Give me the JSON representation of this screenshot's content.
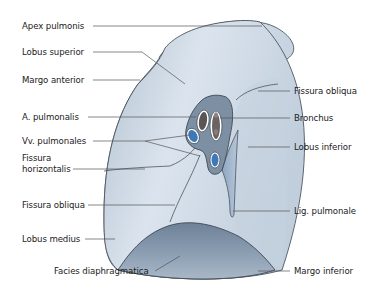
{
  "figure": {
    "title": "",
    "colors": {
      "lung_fill": "#c9d5e2",
      "lung_light": "#dfe7ef",
      "lung_shadow": "#8fa2b8",
      "diaphragm_fill": "#7f92a8",
      "outline": "#4a5560",
      "leader_line": "#555555",
      "vein": "#3d78b8",
      "artery_bronchus": "#5b5656",
      "hilum": "#7d8fa2"
    }
  },
  "labels_left": [
    {
      "id": "apex-pulmonis",
      "text": "Apex pulmonis"
    },
    {
      "id": "lobus-superior",
      "text": "Lobus superior"
    },
    {
      "id": "margo-anterior",
      "text": "Margo anterior"
    },
    {
      "id": "a-pulmonalis",
      "text": "A. pulmonalis"
    },
    {
      "id": "vv-pulmonales",
      "text": "Vv. pulmonales"
    },
    {
      "id": "fissura-horizontalis",
      "text": "Fissura horizontalis",
      "line1": "Fissura",
      "line2": "horizontalis"
    },
    {
      "id": "fissura-obliqua-left",
      "text": "Fissura obliqua"
    },
    {
      "id": "lobus-medius",
      "text": "Lobus medius"
    },
    {
      "id": "facies-diaphragmatica",
      "text": "Facies diaphragmatica"
    }
  ],
  "labels_right": [
    {
      "id": "fissura-obliqua-right",
      "text": "Fissura obliqua"
    },
    {
      "id": "bronchus",
      "text": "Bronchus"
    },
    {
      "id": "lobus-inferior",
      "text": "Lobus inferior"
    },
    {
      "id": "lig-pulmonale",
      "text": "Lig. pulmonale"
    },
    {
      "id": "margo-inferior",
      "text": "Margo inferior"
    }
  ]
}
